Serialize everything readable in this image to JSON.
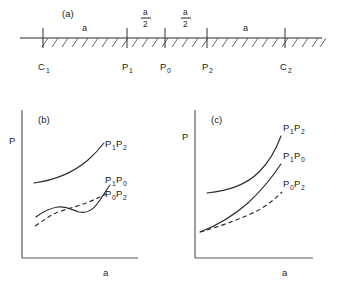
{
  "figure": {
    "panels": [
      {
        "tag": "(a)",
        "kind": "number-line"
      },
      {
        "tag": "(b)",
        "kind": "plot"
      },
      {
        "tag": "(c)",
        "kind": "plot"
      }
    ]
  },
  "panel_a": {
    "tag": "(a)",
    "axis_line": {
      "x_start": 20,
      "x_end": 322,
      "y": 38
    },
    "ticks": [
      {
        "id": "C1",
        "base": "C",
        "sub": "1",
        "x": 43
      },
      {
        "id": "P1",
        "base": "P",
        "sub": "1",
        "x": 127
      },
      {
        "id": "P0",
        "base": "P",
        "sub": "0",
        "x": 165
      },
      {
        "id": "P2",
        "base": "P",
        "sub": "2",
        "x": 207
      },
      {
        "id": "C2",
        "base": "C",
        "sub": "2",
        "x": 285
      }
    ],
    "segments": [
      {
        "label": "a",
        "type": "plain",
        "numerator": "a",
        "denominator": "",
        "x_center": 85
      },
      {
        "label": "a/2",
        "type": "fraction",
        "numerator": "a",
        "denominator": "2",
        "x_center": 146
      },
      {
        "label": "a/2",
        "type": "fraction",
        "numerator": "a",
        "denominator": "2",
        "x_center": 186
      },
      {
        "label": "a",
        "type": "plain",
        "numerator": "a",
        "denominator": "",
        "x_center": 246
      }
    ],
    "hatching": {
      "count": 30,
      "dx": 6,
      "dy": 8,
      "note": "diagonal ticks below axis"
    }
  },
  "panel_b": {
    "tag": "(b)",
    "ylabel": "P",
    "xlabel": "a",
    "axes": {
      "x0": 22,
      "y0": 258,
      "x1": 138,
      "y1": 110
    },
    "curves": [
      {
        "name": "P1P2",
        "base": "P",
        "sub_a": "1",
        "base_b": "P",
        "sub_b": "2",
        "style": "solid",
        "label_x": 105,
        "label_y": 147,
        "path": "M 34 183 C 56 180, 74 172, 88 160 C 96 153, 100 148, 104 143"
      },
      {
        "name": "P1P0",
        "base": "P",
        "sub_a": "1",
        "base_b": "P",
        "sub_b": "0",
        "style": "solid",
        "label_x": 105,
        "label_y": 183,
        "path": "M 36 217 C 44 211, 50 208, 58 207 C 67 206, 72 210, 79 212 C 88 214, 94 209, 100 200 C 104 194, 107 189, 110 185"
      },
      {
        "name": "P0P2",
        "base": "P",
        "sub_a": "0",
        "base_b": "P",
        "sub_b": "2",
        "style": "dashed",
        "label_x": 105,
        "label_y": 196,
        "path": "M 35 226 C 44 220, 52 214, 61 211 C 70 208, 78 206, 86 203 C 94 200, 100 197, 106 194"
      }
    ]
  },
  "panel_c": {
    "tag": "(c)",
    "ylabel": "P",
    "xlabel": "a",
    "axes": {
      "x0": 195,
      "y0": 258,
      "x1": 313,
      "y1": 110
    },
    "curves": [
      {
        "name": "P1P2",
        "base": "P",
        "sub_a": "1",
        "base_b": "P",
        "sub_b": "2",
        "style": "solid",
        "label_x": 281,
        "label_y": 131,
        "path": "M 207 193 C 228 191, 246 185, 259 172 C 270 161, 277 147, 281 136"
      },
      {
        "name": "P1P0",
        "base": "P",
        "sub_a": "1",
        "base_b": "P",
        "sub_b": "0",
        "style": "solid",
        "label_x": 281,
        "label_y": 159,
        "path": "M 200 232 C 216 226, 232 217, 248 203 C 262 190, 273 176, 281 164"
      },
      {
        "name": "P0P2",
        "base": "P",
        "sub_a": "0",
        "base_b": "P",
        "sub_b": "2",
        "style": "dashed",
        "label_x": 281,
        "label_y": 186,
        "path": "M 200 232 C 218 227, 238 220, 257 211 C 268 205, 276 198, 282 192"
      }
    ]
  },
  "colors": {
    "ink": "#1a1a1a",
    "curve": "#2b2b2b",
    "axis": "#555555",
    "hatch": "#4a4a4a",
    "background": "#ffffff"
  }
}
